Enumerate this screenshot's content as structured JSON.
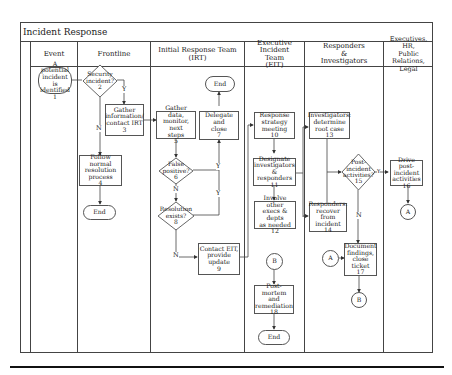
{
  "diagram": {
    "title": "Incident Response",
    "lanes": [
      {
        "id": "event",
        "label": "Event"
      },
      {
        "id": "frontline",
        "label": "Frontline"
      },
      {
        "id": "irt",
        "label": "Initial Response Team (IRT)"
      },
      {
        "id": "eit",
        "label": "Executive Incident Team (EIT)",
        "lines": [
          "Executive Incident",
          "Team",
          "(EIT)"
        ]
      },
      {
        "id": "responders",
        "label": "Responders & Investigators",
        "lines": [
          "Responders",
          "&",
          "Investigators"
        ]
      },
      {
        "id": "executives",
        "label": "Executives, HR, Public Relations, Legal",
        "lines": [
          "Executives, HR,",
          "Public Relations,",
          "Legal"
        ]
      }
    ],
    "nodes": {
      "n1": {
        "lines": [
          "A potential",
          "incident is",
          "identified",
          "1"
        ],
        "shape": "terminator"
      },
      "n2": {
        "lines": [
          "Security",
          "incident?",
          "2"
        ],
        "shape": "decision"
      },
      "n3": {
        "lines": [
          "Gather",
          "information/",
          "contact IRT",
          "3"
        ],
        "shape": "process"
      },
      "n4": {
        "lines": [
          "Follow normal",
          "resolution",
          "process",
          "4"
        ],
        "shape": "process"
      },
      "end_frontline": {
        "label": "End",
        "shape": "terminator"
      },
      "n5": {
        "lines": [
          "Gather data,",
          "monitor, next",
          "steps",
          "5"
        ],
        "shape": "process"
      },
      "n6": {
        "lines": [
          "False",
          "positive?",
          "6"
        ],
        "shape": "decision"
      },
      "n7": {
        "lines": [
          "Delegate and",
          "close",
          "7"
        ],
        "shape": "process"
      },
      "end_irt": {
        "label": "End",
        "shape": "terminator"
      },
      "n8": {
        "lines": [
          "Resolution",
          "exists?",
          "8"
        ],
        "shape": "decision"
      },
      "n9": {
        "lines": [
          "Contact EIT,",
          "provide",
          "update",
          "9"
        ],
        "shape": "process"
      },
      "n10": {
        "lines": [
          "Response",
          "strategy",
          "meeting",
          "10"
        ],
        "shape": "process"
      },
      "n11": {
        "lines": [
          "Designate",
          "investigators",
          "& responders",
          "11"
        ],
        "shape": "process"
      },
      "n12": {
        "lines": [
          "Involve other",
          "execs & depts",
          "as needed",
          "12"
        ],
        "shape": "process"
      },
      "conn_b_eit": {
        "label": "B",
        "shape": "connector"
      },
      "n18": {
        "lines": [
          "Post-",
          "mortem and",
          "remediation",
          "18"
        ],
        "shape": "process"
      },
      "end_eit": {
        "label": "End",
        "shape": "terminator"
      },
      "n13": {
        "lines": [
          "Investigators:",
          "determine",
          "root case",
          "13"
        ],
        "shape": "process"
      },
      "n14": {
        "lines": [
          "Responders:",
          "recover from",
          "incident",
          "14"
        ],
        "shape": "process"
      },
      "n15": {
        "lines": [
          "Post-",
          "incident",
          "activities?",
          "15"
        ],
        "shape": "decision"
      },
      "conn_a_resp": {
        "label": "A",
        "shape": "connector"
      },
      "n17": {
        "lines": [
          "Document",
          "findings,",
          "close ticket",
          "17"
        ],
        "shape": "process"
      },
      "conn_b_resp": {
        "label": "B",
        "shape": "connector"
      },
      "n16": {
        "lines": [
          "Drive post-",
          "incident",
          "activities",
          "16"
        ],
        "shape": "process"
      },
      "conn_a_exec": {
        "label": "A",
        "shape": "connector"
      }
    },
    "edge_labels": {
      "n2_yes": "Y",
      "n2_no": "N",
      "n6_yes": "Y",
      "n6_no": "N",
      "n8_yes": "Y",
      "n8_no": "N",
      "n15_yes": "Y",
      "n15_no": "N"
    }
  }
}
